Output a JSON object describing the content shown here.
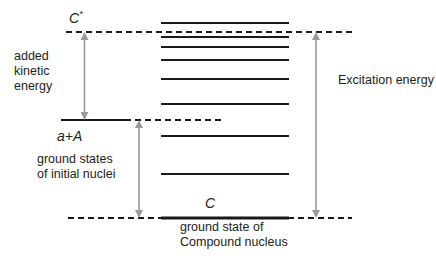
{
  "labels": {
    "compound_excited": "C",
    "compound_excited_sup": "*",
    "initial_nuclei": "a+A",
    "compound_ground": "C",
    "added_kinetic_energy": [
      "added",
      "kinetic",
      "energy"
    ],
    "ground_states_initial": [
      "ground states",
      "of initial nuclei"
    ],
    "ground_state_compound": [
      "ground state of",
      "Compound nucleus"
    ],
    "excitation_energy": "Excitation energy"
  },
  "levels": {
    "compound_states_y": [
      23,
      37,
      47,
      60,
      79,
      104,
      136,
      174
    ],
    "compound_ground_y": 218,
    "initial_ground_y": 120,
    "excited_level_y": 32
  },
  "colors": {
    "line": "#1a1a1a",
    "arrow": "#999999",
    "text": "#222222"
  }
}
